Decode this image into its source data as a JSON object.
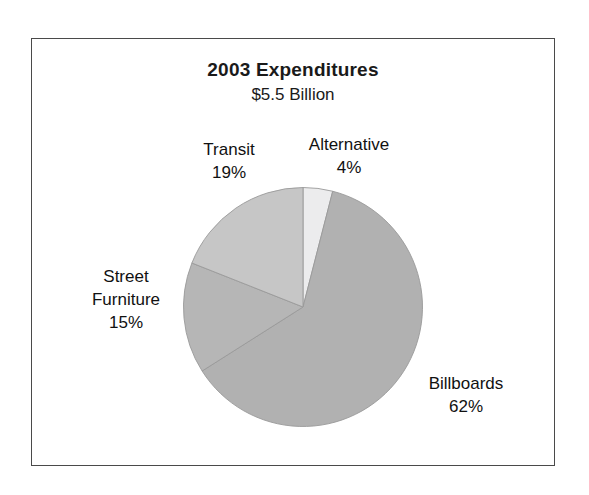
{
  "chart_data": {
    "type": "pie",
    "title": "2003 Expenditures",
    "subtitle": "$5.5 Billion",
    "xlabel": "",
    "ylabel": "",
    "legend_position": "none",
    "grid": false,
    "units": "percent of $5.5 Billion total",
    "start_angle_deg": 0,
    "direction": "clockwise",
    "categories": [
      "Alternative",
      "Billboards",
      "Street Furniture",
      "Transit"
    ],
    "values": [
      4,
      62,
      15,
      19
    ],
    "slices": [
      {
        "name": "Alternative",
        "value": 4,
        "value_label": "4%",
        "color": "#ececed",
        "start_deg": 0,
        "end_deg": 14.4,
        "label_line1": "Alternative",
        "label_line2": "4%"
      },
      {
        "name": "Billboards",
        "value": 62,
        "value_label": "62%",
        "color": "#b1b1b1",
        "start_deg": 14.4,
        "end_deg": 237.6,
        "label_line1": "Billboards",
        "label_line2": "62%"
      },
      {
        "name": "Street Furniture",
        "value": 15,
        "value_label": "15%",
        "color": "#b6b6b6",
        "start_deg": 237.6,
        "end_deg": 291.6,
        "label_line1": "Street",
        "label_line2": "Furniture",
        "label_line3": "15%"
      },
      {
        "name": "Transit",
        "value": 19,
        "value_label": "19%",
        "color": "#c6c6c6",
        "start_deg": 291.6,
        "end_deg": 360,
        "label_line1": "Transit",
        "label_line2": "19%"
      }
    ]
  },
  "figure": {
    "title": "2003 Expenditures",
    "subtitle": "$5.5 Billion",
    "border_color": "#4a4a4a",
    "background": "#ffffff",
    "slice_outline_color": "#9a9a9a"
  },
  "labels": {
    "transit": {
      "name": "Transit",
      "pct": "19%"
    },
    "alternative": {
      "name": "Alternative",
      "pct": "4%"
    },
    "street_furniture": {
      "name_line1": "Street",
      "name_line2": "Furniture",
      "pct": "15%"
    },
    "billboards": {
      "name": "Billboards",
      "pct": "62%"
    }
  }
}
